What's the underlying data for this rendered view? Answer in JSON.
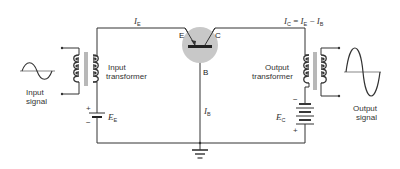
{
  "diagram": {
    "labels": {
      "input_signal_line1": "Input",
      "input_signal_line2": "signal",
      "input_transformer_line1": "Input",
      "input_transformer_line2": "transformer",
      "output_transformer_line1": "Output",
      "output_transformer_line2": "transformer",
      "output_signal_line1": "Output",
      "output_signal_line2": "signal"
    },
    "transistor": {
      "emitter": "E",
      "collector": "C",
      "base": "B",
      "fill_color": "#c8c8c8"
    },
    "currents": {
      "emitter_current": {
        "sym": "I",
        "sub": "E"
      },
      "base_current": {
        "sym": "I",
        "sub": "B"
      },
      "collector_current": {
        "sym": "I",
        "sub": "C",
        "eq": " = ",
        "sym2": "I",
        "sub2": "E",
        "minus": " − ",
        "sym3": "I",
        "sub3": "B"
      }
    },
    "sources": {
      "emitter_supply": {
        "sym": "E",
        "sub": "E",
        "plus": "+",
        "minus": "−"
      },
      "collector_supply": {
        "sym": "E",
        "sub": "C",
        "plus": "+",
        "minus": "−"
      }
    }
  }
}
